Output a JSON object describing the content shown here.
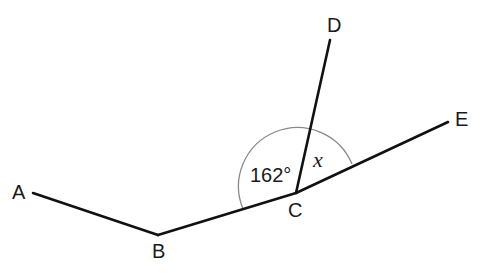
{
  "diagram": {
    "type": "geometry-angles",
    "points": {
      "A": {
        "label": "A"
      },
      "B": {
        "label": "B"
      },
      "C": {
        "label": "C"
      },
      "D": {
        "label": "D"
      },
      "E": {
        "label": "E"
      }
    },
    "segments": [
      "A-B",
      "B-C",
      "C-D",
      "C-E"
    ],
    "angles": {
      "BCD": {
        "label": "162°",
        "value_deg": 162
      },
      "DCE": {
        "label": "x",
        "unknown": true
      }
    },
    "colors": {
      "line": "#111111",
      "arc": "#8a8a8a",
      "background": "#ffffff"
    }
  }
}
